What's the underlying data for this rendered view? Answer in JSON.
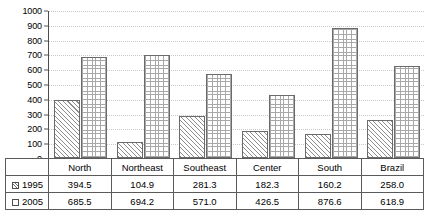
{
  "chart_data": {
    "type": "bar",
    "title": "",
    "subtitle": "",
    "xlabel": "",
    "ylabel": "",
    "grid": true,
    "legend_position": "table-row-labels",
    "ylim": [
      0,
      1000
    ],
    "ytick_step": 100,
    "ytick_labels": [
      "1000",
      "900",
      "800",
      "700",
      "600",
      "500",
      "400",
      "300",
      "200",
      "100",
      "0"
    ],
    "categories": [
      "North",
      "Northeast",
      "Southeast",
      "Center",
      "South",
      "Brazil"
    ],
    "series": [
      {
        "name": "1995",
        "swatch": "diagonal-hatch-swatch",
        "values": [
          394.5,
          104.9,
          281.3,
          182.3,
          160.2,
          258.0
        ],
        "labels": [
          "394.5",
          "104.9",
          "281.3",
          "182.3",
          "160.2",
          "258.0"
        ]
      },
      {
        "name": "2005",
        "swatch": "grid-hatch-swatch",
        "values": [
          685.5,
          694.2,
          571.0,
          426.5,
          876.6,
          618.9
        ],
        "labels": [
          "685.5",
          "694.2",
          "571.0",
          "426.5",
          "876.6",
          "618.9"
        ]
      }
    ]
  },
  "colors": {
    "axis": "#4d4d4d",
    "gridline": "#c9c9c9",
    "bar_outline": "#6b6b6b",
    "hatch_1995": "#8d8d8d",
    "hatch_2005": "#a8a8a8",
    "table_border": "#5a5a5a",
    "text": "#000000",
    "background": "#ffffff"
  },
  "table": {
    "row_label_1995": "1995",
    "row_label_2005": "2005"
  }
}
